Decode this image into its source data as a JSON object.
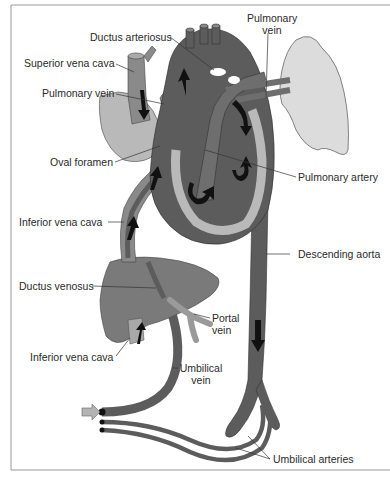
{
  "diagram": {
    "type": "fetal-circulation-anatomy",
    "colors": {
      "dark": "#5c5c5c",
      "medium": "#8a8a8a",
      "light": "#b9b9b9",
      "lung": "#dcdcdc",
      "arrow": "#111111",
      "inlet_arrow": "#b3b3b3",
      "frame": "#9a9a9a",
      "leader": "#333333"
    },
    "labels": {
      "ductus_arteriosus": "Ductus arteriosus",
      "pulmonary_vein_top_line1": "Pulmonary",
      "pulmonary_vein_top_line2": "vein",
      "superior_vena_cava": "Superior vena cava",
      "pulmonary_vein_left": "Pulmonary vein",
      "oval_foramen": "Oval foramen",
      "pulmonary_artery": "Pulmonary artery",
      "inferior_vena_cava_upper": "Inferior vena cava",
      "descending_aorta": "Descending aorta",
      "ductus_venosus": "Ductus venosus",
      "portal_vein_line1": "Portal",
      "portal_vein_line2": "vein",
      "inferior_vena_cava_lower": "Inferior vena cava",
      "umbilical_vein_line1": "Umbilical",
      "umbilical_vein_line2": "vein",
      "umbilical_arteries": "Umbilical arteries"
    }
  }
}
